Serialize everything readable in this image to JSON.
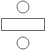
{
  "icon": {
    "name": "divide-symbol",
    "stroke_color": "#6b6b6b",
    "fill_color": "#ffffff",
    "top_circle": {
      "cx": 23,
      "cy": 7,
      "r": 6
    },
    "bar": {
      "x": 1.5,
      "y": 18.5,
      "width": 43,
      "height": 12
    },
    "bottom_circle": {
      "cx": 23,
      "cy": 43,
      "r": 6
    }
  }
}
